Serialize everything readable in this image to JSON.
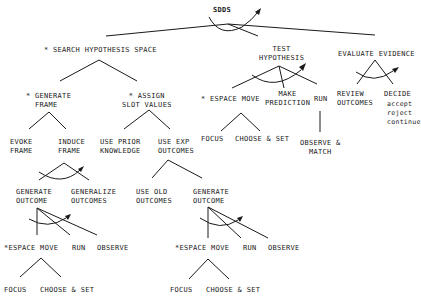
{
  "diagram": {
    "root": "SDDS",
    "level1": {
      "search": "* SEARCH HYPOTHESIS SPACE",
      "test": "TEST\nHYPOTHESIS",
      "evaluate": "EVALUATE EVIDENCE"
    },
    "search_children": {
      "generate_frame": "* GENERATE\n  FRAME",
      "assign_slot": "* ASSIGN\nSLOT VALUES"
    },
    "generate_frame_children": {
      "evoke": "EVOKE\nFRAME",
      "induce": "INDUCE\nFRAME"
    },
    "induce_children": {
      "generate_outcome": "GENERATE\nOUTCOME",
      "generalize": "GENERALIZE\nOUTCOMES"
    },
    "generate_outcome_children_left": {
      "espace_move": "*ESPACE MOVE",
      "run": "RUN",
      "observe": "OBSERVE"
    },
    "espace_children_left": {
      "focus": "FOCUS",
      "choose_set": "CHOOSE & SET"
    },
    "assign_children": {
      "use_prior": "USE PRIOR\nKNOWLEDGE",
      "use_exp": "USE EXP\nOUTCOMES"
    },
    "use_exp_children": {
      "use_old": "USE OLD\nOUTCOMES",
      "generate_outcome": "GENERATE\nOUTCOME"
    },
    "generate_outcome_children_right": {
      "espace_move": "*ESPACE MOVE",
      "run": "RUN",
      "observe": "OBSERVE"
    },
    "espace_children_right": {
      "focus": "FOCUS",
      "choose_set": "CHOOSE & SET"
    },
    "test_children": {
      "espace_move": "* ESPACE MOVE",
      "make_prediction": "MAKE\nPREDICTION",
      "run": "RUN"
    },
    "test_espace_children": {
      "focus": "FOCUS",
      "choose_set": "CHOOSE & SET"
    },
    "run_children": {
      "observe_match": "OBSERVE &\nMATCH"
    },
    "evaluate_children": {
      "review": "REVIEW\nOUTCOMES",
      "decide": "DECIDE",
      "decide_options": "accept\nreject\ncontinue"
    }
  }
}
